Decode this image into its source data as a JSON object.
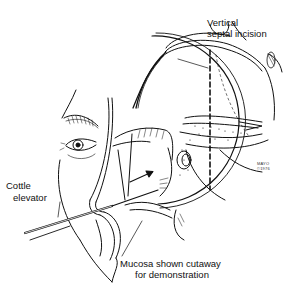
{
  "figure": {
    "type": "medical-illustration",
    "style": "black ink line drawing",
    "colors": {
      "ink": "#111111",
      "background": "#ffffff"
    }
  },
  "labels": {
    "septal_incision_line1": "Vertical",
    "septal_incision_line2": "septal incision",
    "cottle_line1": "Cottle",
    "cottle_line2": "elevator",
    "mucosa_line1": "Mucosa shown cutaway",
    "mucosa_line2": "for demonstration"
  },
  "signature": {
    "line1": "MAYO",
    "line2": "©1976"
  }
}
